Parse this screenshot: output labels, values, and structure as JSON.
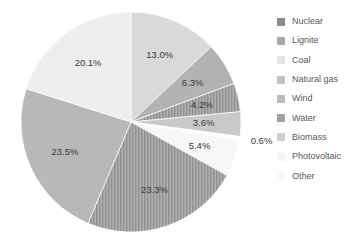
{
  "chart_data": {
    "type": "pie",
    "title": "",
    "xlabel": "",
    "ylabel": "",
    "unit": "%",
    "legend_position": "right",
    "grid": false,
    "start_angle_deg": 0,
    "direction": "clockwise",
    "categories": [
      "Nuclear",
      "Lignite",
      "Coal",
      "Natural gas",
      "Wind",
      "Water",
      "Biomass",
      "Photovoltaic",
      "Other"
    ],
    "values": [
      13.0,
      6.3,
      4.2,
      3.6,
      0.6,
      5.4,
      23.3,
      23.5,
      20.1
    ],
    "value_labels": [
      "13.0%",
      "6.3%",
      "4.2%",
      "3.6%",
      "0.6%",
      "5.4%",
      "23.3%",
      "23.5%",
      "20.1%"
    ],
    "slice_colors": [
      "#d9d9d9",
      "#b3b3b3",
      "#9b9b9b",
      "#c9c9c9",
      "#ffffff",
      "#f7f7f7",
      "#a0a0a0",
      "#b8b8b8",
      "#eeeeee"
    ],
    "slice_patterns": [
      "solid",
      "solid",
      "vertical-stripes",
      "solid",
      "solid",
      "solid",
      "vertical-stripes",
      "solid",
      "solid"
    ],
    "label_outside": [
      false,
      false,
      false,
      false,
      true,
      false,
      false,
      false,
      false
    ]
  },
  "legend": {
    "items": [
      {
        "label": "Nuclear",
        "color": "#8c8c8c"
      },
      {
        "label": "Lignite",
        "color": "#a8a8a8"
      },
      {
        "label": "Coal",
        "color": "#e4e4e4"
      },
      {
        "label": "Natural gas",
        "color": "#c4c4c4"
      },
      {
        "label": "Wind",
        "color": "#bdbdbd"
      },
      {
        "label": "Water",
        "color": "#a3a3a3"
      },
      {
        "label": "Biomass",
        "color": "#cfcfcf"
      },
      {
        "label": "Photovoltaic",
        "color": "#f4f4f4"
      },
      {
        "label": "Other",
        "color": "#fafafa"
      }
    ]
  }
}
